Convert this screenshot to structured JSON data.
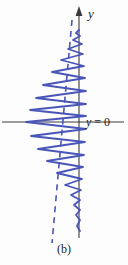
{
  "figure": {
    "caption": "(b)",
    "background_color": "#fdfdfd",
    "axis_color": "#3a3a3a",
    "curve_color": "#4a55b8",
    "dashed_color": "#4a55b8",
    "text_color": "#1d1d1d"
  },
  "labels": {
    "y_axis": "y",
    "y_zero_var": "y",
    "y_zero_rest": " = 0"
  },
  "chart_data": {
    "type": "line",
    "title": "",
    "subtitle": "",
    "xlabel": "",
    "ylabel": "y",
    "grid": false,
    "legend": null,
    "annotations": [
      {
        "text": "y",
        "role": "axis-arrow-label",
        "x": 88,
        "y": 13
      },
      {
        "text": "y = 0",
        "role": "reference-line-label",
        "x": 86,
        "y": 122
      },
      {
        "text": "(b)",
        "role": "panel-caption",
        "x": 64,
        "y": 249
      }
    ],
    "axes": {
      "vertical_axis_x": 79,
      "vertical_axis_top": 10,
      "vertical_axis_bottom": 238,
      "horizontal_axis_y": 122,
      "horizontal_axis_left": 2,
      "horizontal_axis_right": 124,
      "arrow_at_top": true
    },
    "series": [
      {
        "name": "oscillating-wave",
        "color": "#4a55b8",
        "orientation": "vertical",
        "description": "Amplitude-modulated oscillation about the vertical axis; amplitude grows from near zero at the top, peaks near the y = 0 reference line, then decays toward the bottom.",
        "points": [
          [
            79,
            30
          ],
          [
            76,
            33
          ],
          [
            80,
            36
          ],
          [
            73,
            40
          ],
          [
            82,
            44
          ],
          [
            68,
            49
          ],
          [
            83,
            54
          ],
          [
            61,
            60
          ],
          [
            84,
            66
          ],
          [
            52,
            72
          ],
          [
            85,
            78
          ],
          [
            43,
            85
          ],
          [
            86,
            91
          ],
          [
            36,
            98
          ],
          [
            86,
            104
          ],
          [
            30,
            110
          ],
          [
            86,
            116
          ],
          [
            26,
            122
          ],
          [
            86,
            129
          ],
          [
            31,
            136
          ],
          [
            85,
            142
          ],
          [
            38,
            149
          ],
          [
            84,
            155
          ],
          [
            47,
            161
          ],
          [
            83,
            167
          ],
          [
            57,
            173
          ],
          [
            82,
            179
          ],
          [
            65,
            185
          ],
          [
            81,
            190
          ],
          [
            71,
            195
          ],
          [
            80,
            200
          ],
          [
            74,
            205
          ],
          [
            80,
            210
          ],
          [
            76,
            215
          ],
          [
            80,
            220
          ],
          [
            77,
            226
          ],
          [
            80,
            231
          ]
        ]
      },
      {
        "name": "dashed-envelope-line",
        "color": "#4a55b8",
        "style": "dashed",
        "description": "Straight dashed line crossing the wave from upper right to lower left.",
        "points": [
          [
            72,
            20
          ],
          [
            52,
            243
          ]
        ]
      }
    ]
  }
}
